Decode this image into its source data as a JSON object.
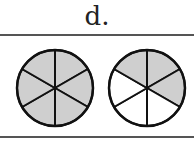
{
  "label": "d.",
  "colors": {
    "shaded": "#cfcfcf",
    "unshaded": "#ffffff",
    "stroke": "#111111"
  },
  "circles": [
    {
      "name": "left-circle",
      "total_parts": 6,
      "shaded_parts": 6,
      "shaded_indices": [
        0,
        1,
        2,
        3,
        4,
        5
      ]
    },
    {
      "name": "right-circle",
      "total_parts": 6,
      "shaded_parts": 3,
      "shaded_indices": [
        0,
        1,
        5
      ]
    }
  ]
}
